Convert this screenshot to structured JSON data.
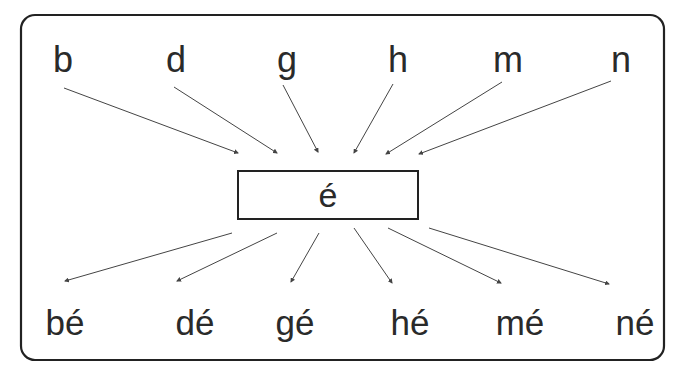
{
  "diagram": {
    "title": "",
    "center": {
      "label": "é",
      "box": {
        "x": 238,
        "y": 171,
        "w": 180,
        "h": 48
      }
    },
    "frame": {
      "x": 21,
      "y": 15,
      "w": 643,
      "h": 345,
      "radius": 14,
      "stroke": "#222222"
    },
    "colors": {
      "text": "#2a2a2a",
      "line": "#444444",
      "background": "#ffffff"
    },
    "consonants": [
      {
        "label": "b",
        "x": 63,
        "y": 72,
        "arrow": [
          64,
          88,
          238,
          153
        ]
      },
      {
        "label": "d",
        "x": 176,
        "y": 72,
        "arrow": [
          174,
          87,
          277,
          153
        ]
      },
      {
        "label": "g",
        "x": 287,
        "y": 72,
        "arrow": [
          283,
          85,
          318,
          152
        ]
      },
      {
        "label": "h",
        "x": 398,
        "y": 72,
        "arrow": [
          393,
          84,
          354,
          153
        ]
      },
      {
        "label": "m",
        "x": 508,
        "y": 72,
        "arrow": [
          502,
          82,
          386,
          154
        ]
      },
      {
        "label": "n",
        "x": 621,
        "y": 72,
        "arrow": [
          611,
          81,
          419,
          154
        ]
      }
    ],
    "syllables": [
      {
        "label": "bé",
        "x": 65,
        "y": 335,
        "arrow": [
          232,
          233,
          65,
          281
        ]
      },
      {
        "label": "dé",
        "x": 195,
        "y": 335,
        "arrow": [
          277,
          233,
          177,
          281
        ]
      },
      {
        "label": "gé",
        "x": 295,
        "y": 335,
        "arrow": [
          319,
          233,
          291,
          282
        ]
      },
      {
        "label": "hé",
        "x": 410,
        "y": 335,
        "arrow": [
          354,
          228,
          392,
          283
        ]
      },
      {
        "label": "mé",
        "x": 520,
        "y": 335,
        "arrow": [
          388,
          228,
          501,
          283
        ]
      },
      {
        "label": "né",
        "x": 635,
        "y": 335,
        "arrow": [
          429,
          228,
          609,
          284
        ]
      }
    ]
  }
}
